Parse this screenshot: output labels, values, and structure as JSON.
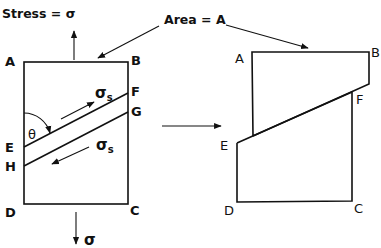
{
  "labels": {
    "stress": "Stress = σ",
    "area": "Area = A",
    "sigma_bottom": "σ",
    "sigma_s": "σ",
    "sigma_s_sub": "s",
    "theta": "θ"
  },
  "left_figure": {
    "corners": {
      "A": "A",
      "B": "B",
      "C": "C",
      "D": "D"
    },
    "plane_points": {
      "E": "E",
      "F": "F",
      "G": "G",
      "H": "H"
    }
  },
  "right_figure": {
    "corners": {
      "A": "A",
      "B": "B",
      "C": "C",
      "D": "D"
    },
    "plane_points": {
      "E": "E",
      "F": "F"
    }
  },
  "colors": {
    "ink": "#111111",
    "background": "#ffffff"
  }
}
